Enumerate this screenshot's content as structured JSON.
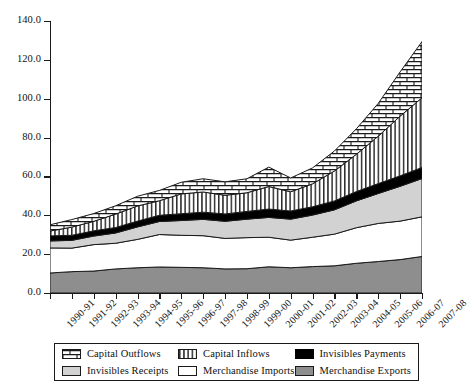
{
  "chart_data": {
    "type": "area",
    "title": "",
    "xlabel": "",
    "ylabel": "",
    "ylim": [
      0.0,
      140.0
    ],
    "yticks": [
      "0.0",
      "20.0",
      "40.0",
      "60.0",
      "80.0",
      "100.0",
      "120.0",
      "140.0"
    ],
    "ytick_values": [
      0,
      20,
      40,
      60,
      80,
      100,
      120,
      140
    ],
    "grid": false,
    "legend_position": "bottom",
    "stacked": true,
    "categories": [
      "1990-91",
      "1991-92",
      "1992-93",
      "1993-94",
      "1994-95",
      "1995-96",
      "1996-97",
      "1997-98",
      "1998-99",
      "1999-00",
      "2000-01",
      "2001-02",
      "2002-03",
      "2003-04",
      "2004-05",
      "2005-06",
      "2006-07",
      "2007-08"
    ],
    "series": [
      {
        "name": "Merchandise Exports",
        "pattern": "solid-mid-gray",
        "color": "#8e8e8e",
        "values": [
          10.3,
          11.0,
          11.3,
          12.4,
          13.0,
          13.4,
          13.2,
          13.0,
          12.4,
          12.5,
          13.5,
          13.0,
          13.6,
          14.0,
          15.3,
          16.2,
          17.2,
          18.8
        ]
      },
      {
        "name": "Merchandise Imports",
        "pattern": "white-outline",
        "color": "#ffffff",
        "values": [
          12.9,
          12.1,
          13.6,
          13.2,
          14.6,
          16.7,
          16.5,
          16.5,
          15.7,
          16.0,
          15.2,
          14.2,
          15.1,
          16.3,
          18.3,
          19.6,
          19.8,
          20.4
        ]
      },
      {
        "name": "Invisibles Receipts",
        "pattern": "solid-light-gray",
        "color": "#d2d2d2",
        "values": [
          3.6,
          4.0,
          4.4,
          5.3,
          6.4,
          6.7,
          7.6,
          8.4,
          8.8,
          9.5,
          10.2,
          10.8,
          11.4,
          12.5,
          13.8,
          15.4,
          17.9,
          19.7
        ]
      },
      {
        "name": "Invisibles Payments",
        "pattern": "solid-black",
        "color": "#000000",
        "values": [
          2.6,
          2.6,
          2.7,
          2.8,
          3.0,
          3.2,
          3.5,
          3.7,
          3.8,
          4.0,
          4.3,
          4.2,
          4.3,
          4.6,
          4.8,
          5.1,
          5.4,
          5.7
        ]
      },
      {
        "name": "Capital Inflows",
        "pattern": "vertical-stripes",
        "color": "#ffffff",
        "values": [
          2.5,
          4.2,
          4.9,
          6.9,
          7.8,
          7.5,
          10.2,
          10.4,
          9.6,
          9.6,
          11.6,
          9.9,
          11.8,
          15.4,
          19.2,
          24.4,
          30.7,
          35.9
        ]
      },
      {
        "name": "Capital Outflows",
        "pattern": "brick",
        "color": "#ffffff",
        "values": [
          3.2,
          3.9,
          4.0,
          4.3,
          5.0,
          5.3,
          6.0,
          6.8,
          6.9,
          7.2,
          10.0,
          7.1,
          8.2,
          10.3,
          13.1,
          16.9,
          22.8,
          28.9
        ]
      }
    ]
  },
  "legend": {
    "items": [
      {
        "label": "Capital Outflows",
        "swatch": "brick-swatch-icon"
      },
      {
        "label": "Capital Inflows",
        "swatch": "vertical-stripe-swatch-icon"
      },
      {
        "label": "Invisibles Payments",
        "swatch": "black-swatch-icon"
      },
      {
        "label": "Invisibles Receipts",
        "swatch": "light-gray-swatch-icon"
      },
      {
        "label": "Merchandise Imports",
        "swatch": "white-swatch-icon"
      },
      {
        "label": "Merchandise Exports",
        "swatch": "mid-gray-swatch-icon"
      }
    ]
  }
}
